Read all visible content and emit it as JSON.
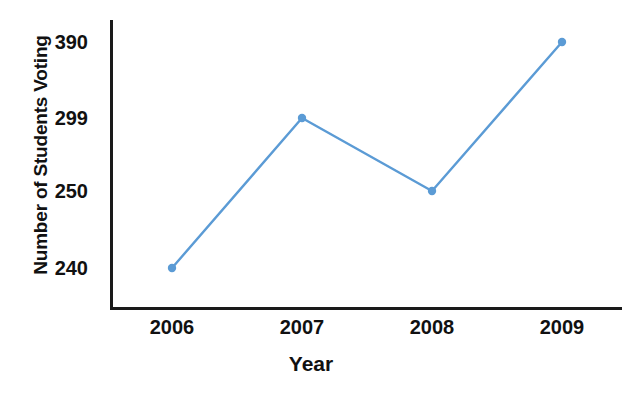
{
  "chart_data": {
    "type": "line",
    "title": "",
    "xlabel": "Year",
    "ylabel": "Number of Students Voting",
    "categories": [
      "2006",
      "2007",
      "2008",
      "2009"
    ],
    "values": [
      240,
      299,
      250,
      390
    ],
    "series": [
      {
        "name": "Number of Students Voting",
        "values": [
          240,
          299,
          250,
          390
        ]
      }
    ],
    "y_tick_labels": [
      "390",
      "299",
      "250",
      "240"
    ],
    "x_tick_labels": [
      "2006",
      "2007",
      "2008",
      "2009"
    ],
    "grid": false,
    "legend": "none",
    "line_color": "#5B9BD5",
    "marker_color": "#5B9BD5",
    "axis_color": "#1A1A1A",
    "background": "#FFFFFF",
    "points": [
      {
        "x_label": "2006",
        "value": 240,
        "px": 172,
        "py": 268
      },
      {
        "x_label": "2007",
        "value": 299,
        "px": 302,
        "py": 118
      },
      {
        "x_label": "2008",
        "value": 250,
        "px": 432,
        "py": 191
      },
      {
        "x_label": "2009",
        "value": 390,
        "px": 562,
        "py": 42
      }
    ],
    "y_ticks": [
      {
        "label": "390",
        "py": 42
      },
      {
        "label": "299",
        "py": 118
      },
      {
        "label": "250",
        "py": 191
      },
      {
        "label": "240",
        "py": 268
      }
    ],
    "x_ticks": [
      {
        "label": "2006",
        "px": 172
      },
      {
        "label": "2007",
        "px": 302
      },
      {
        "label": "2008",
        "px": 432
      },
      {
        "label": "2009",
        "px": 562
      }
    ]
  },
  "labels": {
    "y_axis_title": "Number of Students Voting",
    "x_axis_title": "Year",
    "cropped_title_fragment": ""
  }
}
